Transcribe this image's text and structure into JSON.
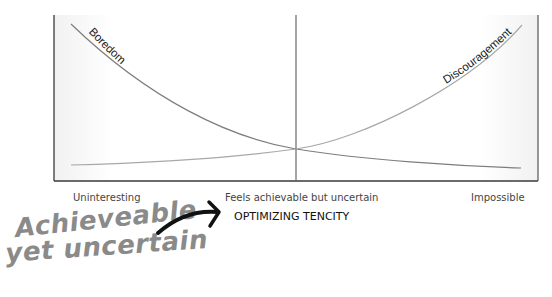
{
  "diagram": {
    "curves": [
      {
        "id": "boredom",
        "label": "Boredom",
        "trend": "decreasing",
        "color": "#7d7d7d"
      },
      {
        "id": "discouragement",
        "label": "Discouragement",
        "trend": "increasing",
        "color": "#a8a8a8"
      }
    ],
    "x_axis": {
      "labels": {
        "left": "Uninteresting",
        "center": "Feels achievable but uncertain",
        "right": "Impossible"
      },
      "title": "OPTIMIZING TENCITY"
    },
    "annotation": {
      "line1": "Achieveable",
      "line2": "yet uncertain",
      "arrow_color": "#111111",
      "text_color": "#8a8a8a"
    }
  }
}
